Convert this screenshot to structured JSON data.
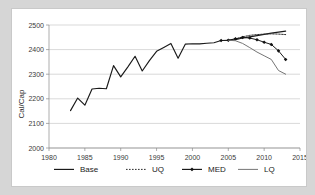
{
  "chart_data": {
    "type": "line",
    "title": "",
    "xlabel": "",
    "ylabel": "Cal/Cap",
    "xlim": [
      1980,
      2015
    ],
    "ylim": [
      2000,
      2500
    ],
    "xticks": [
      1980,
      1985,
      1990,
      1995,
      2000,
      2005,
      2010,
      2015
    ],
    "yticks": [
      2000,
      2100,
      2200,
      2300,
      2400,
      2500
    ],
    "grid": "horizontal",
    "legend_position": "bottom",
    "series": [
      {
        "name": "Base",
        "style": "solid",
        "color": "#1a1a1a",
        "x": [
          1983,
          1984,
          1985,
          1986,
          1987,
          1988,
          1989,
          1990,
          1991,
          1992,
          1993,
          1994,
          1995,
          1996,
          1997,
          1998,
          1999,
          2000,
          2001,
          2002,
          2003,
          2004,
          2005,
          2006,
          2007,
          2008,
          2009,
          2010,
          2011,
          2012,
          2013
        ],
        "values": [
          2152,
          2203,
          2174,
          2240,
          2243,
          2241,
          2335,
          2289,
          2330,
          2373,
          2313,
          2355,
          2393,
          2409,
          2425,
          2365,
          2422,
          2424,
          2423,
          2426,
          2428,
          2437,
          2438,
          2440,
          2447,
          2452,
          2457,
          2462,
          2467,
          2471,
          2475
        ]
      },
      {
        "name": "UQ",
        "style": "dotted",
        "color": "#2a2a2a",
        "x": [
          2005,
          2006,
          2007,
          2008,
          2009,
          2010,
          2011,
          2012,
          2013
        ],
        "values": [
          2438,
          2443,
          2452,
          2458,
          2461,
          2463,
          2464,
          2463,
          2461
        ]
      },
      {
        "name": "MED",
        "style": "solid-markers",
        "marker": "diamond",
        "color": "#1a1a1a",
        "x": [
          2004,
          2005,
          2006,
          2007,
          2008,
          2009,
          2010,
          2011,
          2012,
          2013
        ],
        "values": [
          2437,
          2438,
          2444,
          2449,
          2447,
          2440,
          2430,
          2421,
          2395,
          2360
        ]
      },
      {
        "name": "LQ",
        "style": "solid",
        "color": "#6e6e6e",
        "x": [
          2005,
          2006,
          2007,
          2008,
          2009,
          2010,
          2011,
          2012,
          2013
        ],
        "values": [
          2438,
          2436,
          2425,
          2408,
          2390,
          2375,
          2360,
          2315,
          2300
        ]
      }
    ]
  },
  "axis": {
    "ylabel": "Cal/Cap",
    "ytick_labels": [
      "2000",
      "2100",
      "2200",
      "2300",
      "2400",
      "2500"
    ],
    "xtick_labels": [
      "1980",
      "1985",
      "1990",
      "1995",
      "2000",
      "2005",
      "2010",
      "2015"
    ]
  },
  "legend": {
    "items": [
      {
        "label": "Base",
        "style": "solid",
        "color": "#1a1a1a"
      },
      {
        "label": "UQ",
        "style": "dotted",
        "color": "#2a2a2a"
      },
      {
        "label": "MED",
        "style": "solid-markers",
        "color": "#1a1a1a"
      },
      {
        "label": "LQ",
        "style": "solid",
        "color": "#6e6e6e"
      }
    ]
  }
}
